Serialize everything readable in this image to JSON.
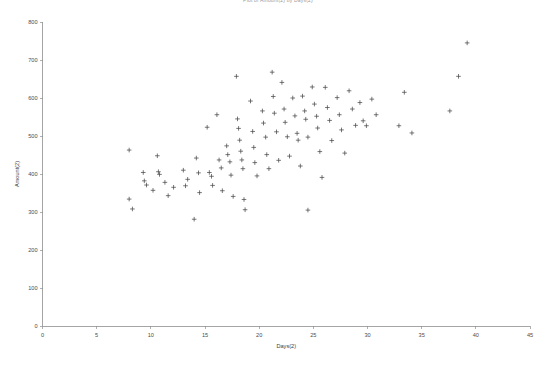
{
  "chart_data": {
    "type": "scatter",
    "title": "Plot of Amount(2) by Days(2)",
    "xlabel": "Days(2)",
    "ylabel": "Amount(2)",
    "xlim": [
      0,
      45
    ],
    "ylim": [
      0,
      800
    ],
    "xticks": [
      0,
      5,
      10,
      15,
      20,
      25,
      30,
      35,
      40,
      45
    ],
    "yticks": [
      0,
      100,
      200,
      300,
      400,
      500,
      600,
      700,
      800
    ],
    "grid": false,
    "legend": null,
    "marker": "plus",
    "marker_color": "#4a4a4a",
    "series": [
      {
        "name": "Amount(2) vs Days(2)",
        "points": [
          [
            8.0,
            463
          ],
          [
            8.0,
            334
          ],
          [
            8.3,
            308
          ],
          [
            9.3,
            404
          ],
          [
            9.4,
            382
          ],
          [
            9.6,
            371
          ],
          [
            10.2,
            357
          ],
          [
            10.6,
            448
          ],
          [
            10.7,
            406
          ],
          [
            10.8,
            399
          ],
          [
            11.3,
            378
          ],
          [
            11.6,
            343
          ],
          [
            12.1,
            365
          ],
          [
            13.0,
            410
          ],
          [
            13.2,
            369
          ],
          [
            13.4,
            386
          ],
          [
            14.0,
            281
          ],
          [
            14.2,
            442
          ],
          [
            14.4,
            403
          ],
          [
            14.5,
            351
          ],
          [
            15.2,
            523
          ],
          [
            15.4,
            404
          ],
          [
            15.6,
            394
          ],
          [
            15.7,
            370
          ],
          [
            16.1,
            556
          ],
          [
            16.3,
            437
          ],
          [
            16.5,
            416
          ],
          [
            16.6,
            356
          ],
          [
            17.0,
            474
          ],
          [
            17.1,
            451
          ],
          [
            17.3,
            432
          ],
          [
            17.4,
            397
          ],
          [
            17.6,
            341
          ],
          [
            17.9,
            657
          ],
          [
            18.0,
            545
          ],
          [
            18.1,
            520
          ],
          [
            18.2,
            489
          ],
          [
            18.3,
            460
          ],
          [
            18.4,
            437
          ],
          [
            18.5,
            414
          ],
          [
            18.6,
            333
          ],
          [
            18.7,
            306
          ],
          [
            19.2,
            592
          ],
          [
            19.4,
            512
          ],
          [
            19.5,
            470
          ],
          [
            19.6,
            430
          ],
          [
            19.8,
            395
          ],
          [
            20.3,
            566
          ],
          [
            20.4,
            534
          ],
          [
            20.6,
            497
          ],
          [
            20.7,
            451
          ],
          [
            20.9,
            414
          ],
          [
            21.2,
            668
          ],
          [
            21.3,
            604
          ],
          [
            21.4,
            560
          ],
          [
            21.6,
            511
          ],
          [
            21.8,
            436
          ],
          [
            22.1,
            641
          ],
          [
            22.3,
            571
          ],
          [
            22.4,
            536
          ],
          [
            22.6,
            498
          ],
          [
            22.8,
            447
          ],
          [
            23.1,
            600
          ],
          [
            23.3,
            553
          ],
          [
            23.5,
            507
          ],
          [
            23.6,
            489
          ],
          [
            23.8,
            421
          ],
          [
            24.0,
            605
          ],
          [
            24.2,
            566
          ],
          [
            24.3,
            544
          ],
          [
            24.5,
            497
          ],
          [
            24.5,
            305
          ],
          [
            24.9,
            629
          ],
          [
            25.1,
            584
          ],
          [
            25.3,
            552
          ],
          [
            25.4,
            521
          ],
          [
            25.6,
            459
          ],
          [
            25.8,
            391
          ],
          [
            26.1,
            628
          ],
          [
            26.3,
            575
          ],
          [
            26.5,
            541
          ],
          [
            26.7,
            488
          ],
          [
            27.2,
            601
          ],
          [
            27.4,
            556
          ],
          [
            27.6,
            516
          ],
          [
            27.9,
            455
          ],
          [
            28.3,
            619
          ],
          [
            28.6,
            571
          ],
          [
            28.9,
            528
          ],
          [
            29.3,
            588
          ],
          [
            29.6,
            540
          ],
          [
            29.9,
            527
          ],
          [
            30.4,
            597
          ],
          [
            30.8,
            556
          ],
          [
            32.9,
            527
          ],
          [
            33.4,
            615
          ],
          [
            34.1,
            508
          ],
          [
            37.6,
            566
          ],
          [
            38.4,
            657
          ],
          [
            39.2,
            745
          ]
        ]
      }
    ]
  },
  "axes": {
    "y_axis_title": "Amount(2)",
    "x_axis_title": "Days(2)"
  }
}
